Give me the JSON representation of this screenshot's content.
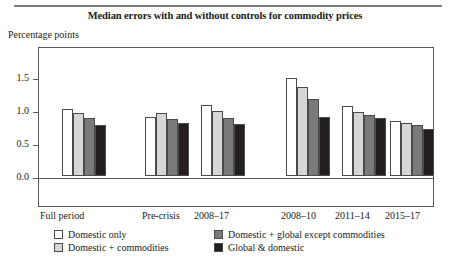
{
  "chart_data": {
    "type": "bar",
    "title": "Median errors with and without controls for commodity prices",
    "ylabel": "Percentage points",
    "xlabel": "",
    "categories": [
      "Full period",
      "Pre-crisis",
      "2008–17",
      "2008–10",
      "2011–14",
      "2015–17"
    ],
    "series": [
      {
        "name": "Domestic only",
        "color": "#ffffff",
        "values": [
          1.02,
          0.9,
          1.07,
          1.48,
          1.06,
          0.84
        ]
      },
      {
        "name": "Domestic + commodities",
        "color": "#d6d6d6",
        "values": [
          0.95,
          0.95,
          0.98,
          1.35,
          0.97,
          0.81
        ]
      },
      {
        "name": "Domestic + global except commodities",
        "color": "#7a7a7a",
        "values": [
          0.88,
          0.87,
          0.88,
          1.16,
          0.92,
          0.77
        ]
      },
      {
        "name": "Global & domestic",
        "color": "#231f1f",
        "values": [
          0.78,
          0.8,
          0.79,
          0.9,
          0.88,
          0.71
        ]
      }
    ],
    "yticks": [
      "0.0",
      "0.5",
      "1.0",
      "1.5"
    ],
    "ytick_values": [
      0.0,
      0.5,
      1.0,
      1.5
    ],
    "ylim": [
      0.0,
      1.72
    ],
    "grid": false,
    "legend_position": "bottom"
  },
  "legend": {
    "rows": [
      {
        "left": "Domestic only",
        "right": "Domestic + global except commodities"
      },
      {
        "left": "Domestic + commodities",
        "right": "Global & domestic"
      }
    ]
  }
}
